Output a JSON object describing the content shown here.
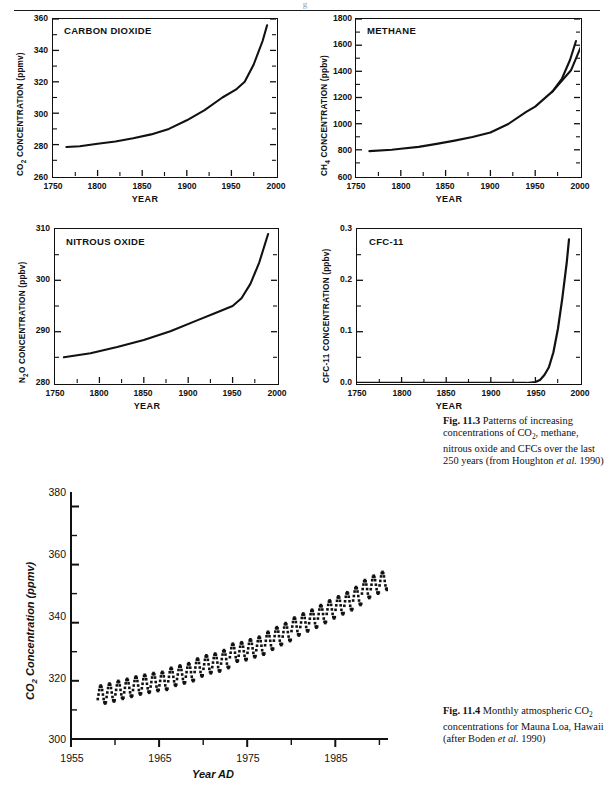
{
  "page": {
    "header_mark": "g"
  },
  "figures": [
    {
      "id": "carbon-dioxide",
      "panel_title": "CARBON DIOXIDE",
      "ylabel_main": "CO",
      "ylabel_sub": "2",
      "ylabel_tail": " CONCENTRATION (ppmv)",
      "xlabel": "YEAR",
      "yticks": [
        "360",
        "340",
        "320",
        "300",
        "280",
        "260"
      ],
      "xticks": [
        "1750",
        "1800",
        "1850",
        "1900",
        "1950",
        "2000"
      ]
    },
    {
      "id": "methane",
      "panel_title": "METHANE",
      "ylabel_main": "CH",
      "ylabel_sub": "4",
      "ylabel_tail": " CONCENTRATION (ppbv)",
      "xlabel": "YEAR",
      "yticks": [
        "1800",
        "1600",
        "1400",
        "1200",
        "1000",
        "800",
        "600"
      ],
      "xticks": [
        "1750",
        "1800",
        "1850",
        "1900",
        "1950",
        "2000"
      ]
    },
    {
      "id": "nitrous-oxide",
      "panel_title": "NITROUS OXIDE",
      "ylabel_main": "N",
      "ylabel_sub": "2",
      "ylabel_tail": "O CONCENTRATION (ppbv)",
      "xlabel": "YEAR",
      "yticks": [
        "310",
        "300",
        "290",
        "280"
      ],
      "xticks": [
        "1750",
        "1800",
        "1850",
        "1900",
        "1950",
        "2000"
      ]
    },
    {
      "id": "cfc-11",
      "panel_title": "CFC-11",
      "ylabel_main": "CFC-11",
      "ylabel_sub": "",
      "ylabel_tail": " CONCENTRATION (ppbv)",
      "xlabel": "YEAR",
      "yticks": [
        "0.3",
        "0.2",
        "0.1",
        "0.0"
      ],
      "xticks": [
        "1750",
        "1800",
        "1850",
        "1900",
        "1950",
        "2000"
      ]
    }
  ],
  "captions": {
    "fig_11_3_label": "Fig. 11.3",
    "fig_11_3_text_1": " Patterns of increasing concentrations of CO",
    "fig_11_3_sub": "2",
    "fig_11_3_text_2": ", methane, nitrous oxide and CFCs over the last 250 years (from Houghton ",
    "fig_11_3_italic": "et al.",
    "fig_11_3_text_3": " 1990)",
    "fig_11_4_label": "Fig. 11.4",
    "fig_11_4_text_1": " Monthly atmospheric CO",
    "fig_11_4_sub": "2",
    "fig_11_4_text_2": " concentrations for Mauna Loa, Hawaii (after Boden ",
    "fig_11_4_italic": "et al.",
    "fig_11_4_text_3": " 1990)"
  },
  "mauna_loa": {
    "ylabel_main": "CO",
    "ylabel_sub": "2",
    "ylabel_tail": " Concentration (ppmv)",
    "xlabel": "Year AD",
    "yticks": [
      "380",
      "360",
      "340",
      "320",
      "300"
    ],
    "xticks": [
      "1955",
      "1965",
      "1975",
      "1985"
    ]
  },
  "chart_data": [
    {
      "type": "line",
      "id": "carbon-dioxide",
      "title": "CARBON DIOXIDE",
      "xlabel": "YEAR",
      "ylabel": "CO2 CONCENTRATION (ppmv)",
      "xlim": [
        1750,
        2000
      ],
      "ylim": [
        260,
        360
      ],
      "yticks": [
        260,
        280,
        300,
        320,
        340,
        360
      ],
      "xticks": [
        1750,
        1800,
        1850,
        1900,
        1950,
        2000
      ],
      "grid": false,
      "legend": null,
      "x": [
        1765,
        1780,
        1800,
        1820,
        1840,
        1860,
        1880,
        1900,
        1920,
        1940,
        1955,
        1965,
        1975,
        1985,
        1990
      ],
      "values": [
        278.5,
        279,
        280.5,
        282,
        284,
        286.5,
        290,
        295.5,
        302,
        310,
        315,
        320,
        331,
        346,
        356
      ]
    },
    {
      "type": "line",
      "id": "methane",
      "title": "METHANE",
      "xlabel": "YEAR",
      "ylabel": "CH4 CONCENTRATION (ppbv)",
      "xlim": [
        1750,
        2000
      ],
      "ylim": [
        600,
        1800
      ],
      "yticks": [
        600,
        800,
        1000,
        1200,
        1400,
        1600,
        1800
      ],
      "xticks": [
        1750,
        1800,
        1850,
        1900,
        1950,
        2000
      ],
      "grid": false,
      "legend": null,
      "x": [
        1765,
        1790,
        1800,
        1820,
        1840,
        1860,
        1880,
        1900,
        1920,
        1940,
        1950,
        1960,
        1970,
        1980,
        1988
      ],
      "values": [
        790,
        800,
        808,
        822,
        845,
        870,
        900,
        940,
        1000,
        1090,
        1130,
        1250,
        1400,
        1570,
        1740
      ]
    },
    {
      "type": "line",
      "id": "nitrous-oxide",
      "title": "NITROUS OXIDE",
      "xlabel": "YEAR",
      "ylabel": "N2O CONCENTRATION (ppbv)",
      "xlim": [
        1750,
        2000
      ],
      "ylim": [
        280,
        310
      ],
      "yticks": [
        280,
        290,
        300,
        310
      ],
      "xticks": [
        1750,
        1800,
        1850,
        1900,
        1950,
        2000
      ],
      "grid": false,
      "legend": null,
      "x": [
        1760,
        1790,
        1820,
        1850,
        1880,
        1910,
        1930,
        1950,
        1960,
        1970,
        1980,
        1990
      ],
      "values": [
        285,
        285.8,
        287,
        288.4,
        290.1,
        292.2,
        293.6,
        295,
        296.5,
        299.5,
        304,
        310
      ]
    },
    {
      "type": "line",
      "id": "cfc-11",
      "title": "CFC-11",
      "xlabel": "YEAR",
      "ylabel": "CFC-11 CONCENTRATION (ppbv)",
      "xlim": [
        1750,
        2000
      ],
      "ylim": [
        0.0,
        0.3
      ],
      "yticks": [
        0.0,
        0.1,
        0.2,
        0.3
      ],
      "xticks": [
        1750,
        1800,
        1850,
        1900,
        1950,
        2000
      ],
      "grid": false,
      "legend": null,
      "x": [
        1750,
        1940,
        1950,
        1955,
        1960,
        1965,
        1970,
        1975,
        1980,
        1985,
        1988
      ],
      "values": [
        0.0,
        0.0,
        0.002,
        0.006,
        0.014,
        0.03,
        0.06,
        0.105,
        0.165,
        0.235,
        0.28
      ]
    },
    {
      "type": "scatter",
      "id": "mauna-loa",
      "title": "Monthly atmospheric CO2 concentrations for Mauna Loa, Hawaii",
      "xlabel": "Year AD",
      "ylabel": "CO2 Concentration (ppmv)",
      "xlim": [
        1955,
        1991
      ],
      "ylim": [
        300,
        385
      ],
      "yticks": [
        300,
        320,
        340,
        360,
        380
      ],
      "xticks": [
        1955,
        1965,
        1975,
        1985
      ],
      "minor_xticks": [
        1960,
        1970,
        1980,
        1990
      ],
      "minor_yticks": [
        310,
        330,
        350,
        370
      ],
      "grid": false,
      "legend": null,
      "description": "Monthly mean values, 1958-1990, rising trend with annual seasonal oscillation of about 6 ppmv peak-to-peak",
      "annual_means": [
        {
          "year": 1958,
          "value": 315.3
        },
        {
          "year": 1959,
          "value": 316.0
        },
        {
          "year": 1960,
          "value": 316.9
        },
        {
          "year": 1961,
          "value": 317.6
        },
        {
          "year": 1962,
          "value": 318.4
        },
        {
          "year": 1963,
          "value": 319.0
        },
        {
          "year": 1964,
          "value": 319.6
        },
        {
          "year": 1965,
          "value": 320.0
        },
        {
          "year": 1966,
          "value": 321.4
        },
        {
          "year": 1967,
          "value": 322.2
        },
        {
          "year": 1968,
          "value": 323.0
        },
        {
          "year": 1969,
          "value": 324.6
        },
        {
          "year": 1970,
          "value": 325.7
        },
        {
          "year": 1971,
          "value": 326.3
        },
        {
          "year": 1972,
          "value": 327.5
        },
        {
          "year": 1973,
          "value": 329.7
        },
        {
          "year": 1974,
          "value": 330.2
        },
        {
          "year": 1975,
          "value": 331.2
        },
        {
          "year": 1976,
          "value": 332.1
        },
        {
          "year": 1977,
          "value": 333.8
        },
        {
          "year": 1978,
          "value": 335.4
        },
        {
          "year": 1979,
          "value": 336.8
        },
        {
          "year": 1980,
          "value": 338.7
        },
        {
          "year": 1981,
          "value": 340.1
        },
        {
          "year": 1982,
          "value": 341.4
        },
        {
          "year": 1983,
          "value": 343.0
        },
        {
          "year": 1984,
          "value": 344.6
        },
        {
          "year": 1985,
          "value": 346.0
        },
        {
          "year": 1986,
          "value": 347.4
        },
        {
          "year": 1987,
          "value": 349.2
        },
        {
          "year": 1988,
          "value": 351.6
        },
        {
          "year": 1989,
          "value": 353.1
        },
        {
          "year": 1990,
          "value": 354.4
        }
      ],
      "seasonal_amplitude": 3.1
    }
  ]
}
